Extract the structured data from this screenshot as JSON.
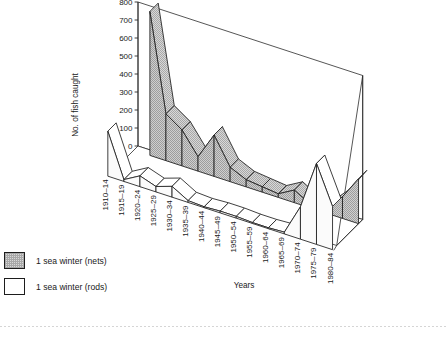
{
  "chart_data": {
    "type": "line",
    "render_style": "3d-ribbon",
    "title": "",
    "xlabel": "Years",
    "ylabel": "No. of fish caught",
    "ylim": [
      0,
      800
    ],
    "ytick_step": 100,
    "yticks": [
      "0",
      "100",
      "200",
      "300",
      "400",
      "500",
      "600",
      "700",
      "800"
    ],
    "grid": false,
    "legend_position": "bottom-left",
    "categories": [
      "1910–14",
      "1915–19",
      "1920–24",
      "1925–29",
      "1930–34",
      "1935–39",
      "1940–44",
      "1945–49",
      "1950–54",
      "1955–59",
      "1960–64",
      "1965–69",
      "1970–74",
      "1975–79",
      "1980–84"
    ],
    "series": [
      {
        "name": "1 sea winter (nets)",
        "fill": "#c9c9c9",
        "values": [
          null,
          800,
          260,
          200,
          80,
          230,
          80,
          40,
          30,
          20,
          70,
          20,
          30,
          120,
          250
        ]
      },
      {
        "name": "1 sea winter (rods)",
        "fill": "#ffffff",
        "values": [
          250,
          10,
          60,
          30,
          60,
          10,
          5,
          10,
          10,
          5,
          5,
          10,
          180,
          450,
          240
        ]
      }
    ]
  },
  "legend": {
    "items": [
      {
        "label": "1 sea winter (nets)",
        "swatch": "hatched-gray"
      },
      {
        "label": "1 sea winter (rods)",
        "swatch": "white"
      }
    ]
  },
  "axes": {
    "y_label": "No. of fish caught",
    "x_label": "Years"
  },
  "colors": {
    "nets_fill": "#c9c9c9",
    "rods_fill": "#ffffff",
    "stroke": "#1d1d1d",
    "text": "#1a1a1a"
  }
}
